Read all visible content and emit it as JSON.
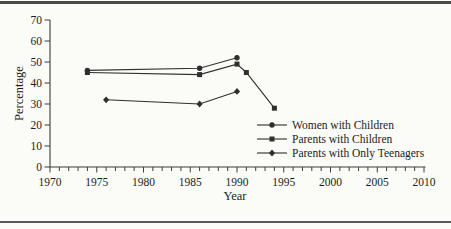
{
  "figure": {
    "background_color": "#fbfbf7",
    "rule_color": "#4a4a4a"
  },
  "chart_data": {
    "type": "line",
    "title": "",
    "xlabel": "Year",
    "ylabel": "Percentage",
    "xlim": [
      1970,
      2010
    ],
    "ylim": [
      0,
      70
    ],
    "x_major_ticks": [
      1970,
      1975,
      1980,
      1985,
      1990,
      1995,
      2000,
      2005,
      2010
    ],
    "x_minor_tick_step": 1,
    "y_ticks": [
      0,
      10,
      20,
      30,
      40,
      50,
      60,
      70
    ],
    "grid": false,
    "line_color": "#2f2f2f",
    "axis_color": "#3c3c3c",
    "text_color": "#1c1c1c",
    "legend_position": "inside-lower-right",
    "series": [
      {
        "name": "Women with Children",
        "marker": "circle",
        "points": [
          [
            1974,
            46
          ],
          [
            1986,
            47
          ],
          [
            1990,
            52
          ]
        ]
      },
      {
        "name": "Parents with Children",
        "marker": "square",
        "points": [
          [
            1974,
            45
          ],
          [
            1986,
            44
          ],
          [
            1990,
            49
          ],
          [
            1991,
            45
          ],
          [
            1994,
            28
          ]
        ]
      },
      {
        "name": "Parents with Only Teenagers",
        "marker": "diamond",
        "points": [
          [
            1976,
            32
          ],
          [
            1986,
            30
          ],
          [
            1990,
            36
          ]
        ]
      }
    ]
  }
}
